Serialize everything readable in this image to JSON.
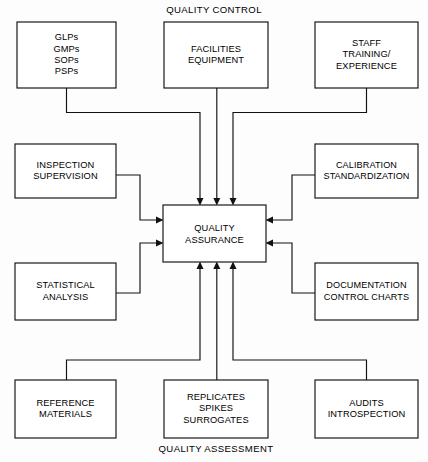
{
  "diagram": {
    "title_top": "QUALITY CONTROL",
    "title_bottom": "QUALITY ASSESSMENT",
    "center": {
      "id": "quality-assurance",
      "label": "QUALITY\nASSURANCE"
    },
    "boxes": [
      {
        "id": "glps-gmps-sops-psps",
        "name": "box-glps-gmps-sops-psps",
        "label": "GLPs\nGMPs\nSOPs\nPSPs",
        "x": 17,
        "y": 22,
        "w": 99,
        "h": 66
      },
      {
        "id": "facilities-equipment",
        "name": "box-facilities-equipment",
        "label": "FACILITIES\nEQUIPMENT",
        "x": 164,
        "y": 22,
        "w": 104,
        "h": 66
      },
      {
        "id": "staff-training-experience",
        "name": "box-staff-training-experience",
        "label": "STAFF\nTRAINING/\nEXPERIENCE",
        "x": 315,
        "y": 22,
        "w": 103,
        "h": 66
      },
      {
        "id": "inspection-supervision",
        "name": "box-inspection-supervision",
        "label": "INSPECTION\nSUPERVISION",
        "x": 15,
        "y": 144,
        "w": 101,
        "h": 54
      },
      {
        "id": "calibration-standardization",
        "name": "box-calibration-standardization",
        "label": "CALIBRATION\nSTANDARDIZATION",
        "x": 315,
        "y": 144,
        "w": 103,
        "h": 54
      },
      {
        "id": "statistical-analysis",
        "name": "box-statistical-analysis",
        "label": "STATISTICAL\nANALYSIS",
        "x": 15,
        "y": 263,
        "w": 101,
        "h": 57
      },
      {
        "id": "documentation-control-charts",
        "name": "box-documentation-control-charts",
        "label": "DOCUMENTATION\nCONTROL CHARTS",
        "x": 315,
        "y": 263,
        "w": 103,
        "h": 57
      },
      {
        "id": "reference-materials",
        "name": "box-reference-materials",
        "label": "REFERENCE\nMATERIALS",
        "x": 15,
        "y": 380,
        "w": 101,
        "h": 58
      },
      {
        "id": "replicates-spikes-surrogates",
        "name": "box-replicates-spikes-surrogates",
        "label": "REPLICATES\nSPIKES\nSURROGATES",
        "x": 164,
        "y": 380,
        "w": 104,
        "h": 58
      },
      {
        "id": "audits-introspection",
        "name": "box-audits-introspection",
        "label": "AUDITS\nINTROSPECTION",
        "x": 315,
        "y": 380,
        "w": 103,
        "h": 58
      }
    ],
    "center_box": {
      "x": 163,
      "y": 205,
      "w": 103,
      "h": 57
    },
    "colors": {
      "line": "#111111",
      "box_fill": "#ffffff",
      "background": "#fdfdfd",
      "text": "#000000"
    },
    "connections": [
      {
        "from": "glps-gmps-sops-psps",
        "to": "quality-assurance",
        "direction": "down"
      },
      {
        "from": "facilities-equipment",
        "to": "quality-assurance",
        "direction": "down"
      },
      {
        "from": "staff-training-experience",
        "to": "quality-assurance",
        "direction": "down"
      },
      {
        "from": "inspection-supervision",
        "to": "quality-assurance",
        "direction": "right"
      },
      {
        "from": "statistical-analysis",
        "to": "quality-assurance",
        "direction": "right"
      },
      {
        "from": "calibration-standardization",
        "to": "quality-assurance",
        "direction": "left"
      },
      {
        "from": "documentation-control-charts",
        "to": "quality-assurance",
        "direction": "left"
      },
      {
        "from": "reference-materials",
        "to": "quality-assurance",
        "direction": "up"
      },
      {
        "from": "replicates-spikes-surrogates",
        "to": "quality-assurance",
        "direction": "up"
      },
      {
        "from": "audits-introspection",
        "to": "quality-assurance",
        "direction": "up"
      }
    ]
  }
}
